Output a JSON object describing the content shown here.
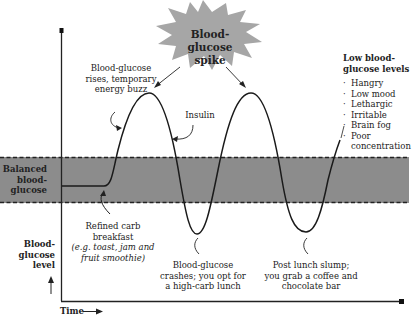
{
  "title": {
    "line1": "Blood-glucose",
    "line2": "spike"
  },
  "annotations": {
    "rise": {
      "line1": "Blood-glucose",
      "line2": "rises, temporary",
      "line3": "energy buzz"
    },
    "insulin": "Insulin",
    "breakfast": {
      "line1": "Refined carb",
      "line2": "breakfast",
      "line3": "(e.g. toast, jam and",
      "line4": "fruit smoothie)"
    },
    "crash": {
      "line1": "Blood-glucose",
      "line2": "crashes; you opt for",
      "line3": "a high-carb lunch"
    },
    "slump": {
      "line1": "Post lunch slump;",
      "line2": "you grab a coffee and",
      "line3": "chocolate bar"
    }
  },
  "band_label": {
    "line1": "Balanced",
    "line2": "blood-",
    "line3": "glucose"
  },
  "y_axis_label": {
    "line1": "Blood-",
    "line2": "glucose",
    "line3": "level"
  },
  "x_axis_label": "Time",
  "low_levels": {
    "heading": {
      "line1": "Low blood-",
      "line2": "glucose levels"
    },
    "items": [
      "Hangry",
      "Low mood",
      "Lethargic",
      "Irritable",
      "Brain fog",
      "Poor concentration"
    ]
  },
  "colors": {
    "band": "#8c8c8c",
    "burst": "#a6a6a6",
    "line": "#1a1a1a"
  }
}
